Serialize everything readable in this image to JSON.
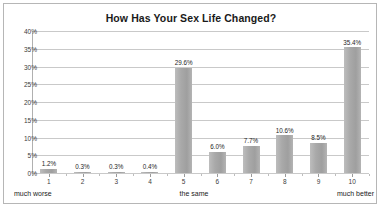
{
  "chart_data": {
    "type": "bar",
    "title": "How Has Your Sex Life Changed?",
    "xlabel": "",
    "ylabel": "",
    "categories": [
      "1",
      "2",
      "3",
      "4",
      "5",
      "6",
      "7",
      "8",
      "9",
      "10"
    ],
    "values": [
      1.2,
      0.3,
      0.3,
      0.4,
      29.6,
      6.0,
      7.7,
      10.6,
      8.5,
      35.4
    ],
    "data_labels": [
      "1.2%",
      "0.3%",
      "0.3%",
      "0.4%",
      "29.6%",
      "6.0%",
      "7.7%",
      "10.6%",
      "8.5%",
      "35.4%"
    ],
    "ylim": [
      0,
      40
    ],
    "ytick_values": [
      0,
      5,
      10,
      15,
      20,
      25,
      30,
      35,
      40
    ],
    "ytick_labels": [
      "0%",
      "5%",
      "10%",
      "15%",
      "20%",
      "25%",
      "30%",
      "35%",
      "40%"
    ],
    "grid": true,
    "legend": false,
    "legend_position": "none",
    "bar_color": "#a9a9a9",
    "gridline_color": "#c9c9c9",
    "frame_color": "#b6b6b6",
    "axis_captions": {
      "left": "much worse",
      "middle": "the same",
      "right": "much better"
    }
  }
}
